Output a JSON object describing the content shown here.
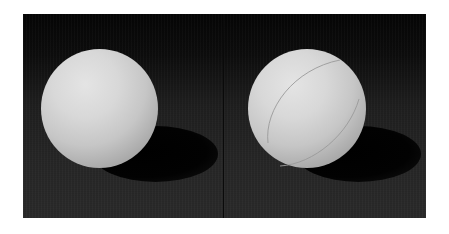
{
  "image": {
    "description": "Two white spheres side by side on a dark background under a single light from the upper left, each casting an elliptical shadow toward the lower right. The right sphere has a thin curved seam line.",
    "panels": [
      {
        "id": "left",
        "subject": "plain white sphere",
        "has_seam": false
      },
      {
        "id": "right",
        "subject": "white sphere with seam line",
        "has_seam": true
      }
    ],
    "colors": {
      "background": "#ffffff",
      "backdrop_dark": "#0d0d0d",
      "floor": "#262626",
      "sphere_highlight": "#e4e4e4",
      "sphere_shade": "#6e6e6e",
      "shadow": "#000000"
    }
  }
}
